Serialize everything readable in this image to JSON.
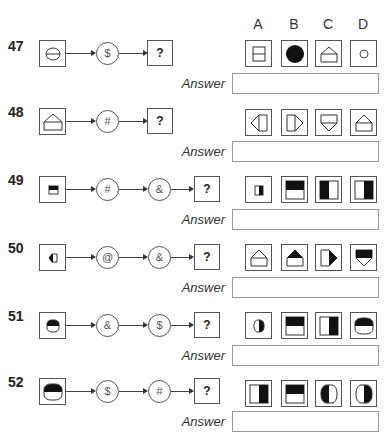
{
  "option_headers": [
    "A",
    "B",
    "C",
    "D"
  ],
  "answer_label": "Answer",
  "questions": [
    {
      "number": "47",
      "start_shape": "circle-with-horizontal-line",
      "operators": [
        "$"
      ],
      "unknown": "?",
      "options": [
        "rectangle-with-horizontal-line",
        "filled-black-circle",
        "house-pentagon-outline",
        "small-circle-outline"
      ],
      "answer": ""
    },
    {
      "number": "48",
      "start_shape": "house-pentagon-outline",
      "operators": [
        "#"
      ],
      "unknown": "?",
      "options": [
        "arrow-pentagon-left",
        "arrow-pentagon-right",
        "pentagon-point-down",
        "house-pentagon-up"
      ],
      "answer": ""
    },
    {
      "number": "49",
      "start_shape": "small-square-top-black",
      "operators": [
        "#",
        "&"
      ],
      "unknown": "?",
      "options": [
        "small-square-right-black",
        "large-square-top-black",
        "large-square-left-black",
        "large-square-right-black"
      ],
      "answer": ""
    },
    {
      "number": "50",
      "start_shape": "small-pentagon-left-black-tip",
      "operators": [
        "@",
        "&"
      ],
      "unknown": "?",
      "options": [
        "house-pentagon-outline",
        "house-pentagon-top-black",
        "pentagon-right-black-tip",
        "pentagon-down-black-top"
      ],
      "answer": ""
    },
    {
      "number": "51",
      "start_shape": "small-rounded-top-black",
      "operators": [
        "&",
        "$"
      ],
      "unknown": "?",
      "options": [
        "small-rounded-right-black",
        "square-top-black",
        "square-right-black",
        "rounded-top-black"
      ],
      "answer": ""
    },
    {
      "number": "52",
      "start_shape": "large-rounded-top-black",
      "operators": [
        "$",
        "#"
      ],
      "unknown": "?",
      "options": [
        "square-right-black",
        "square-top-black",
        "rounded-left-black",
        "rounded-right-black"
      ],
      "answer": ""
    }
  ]
}
